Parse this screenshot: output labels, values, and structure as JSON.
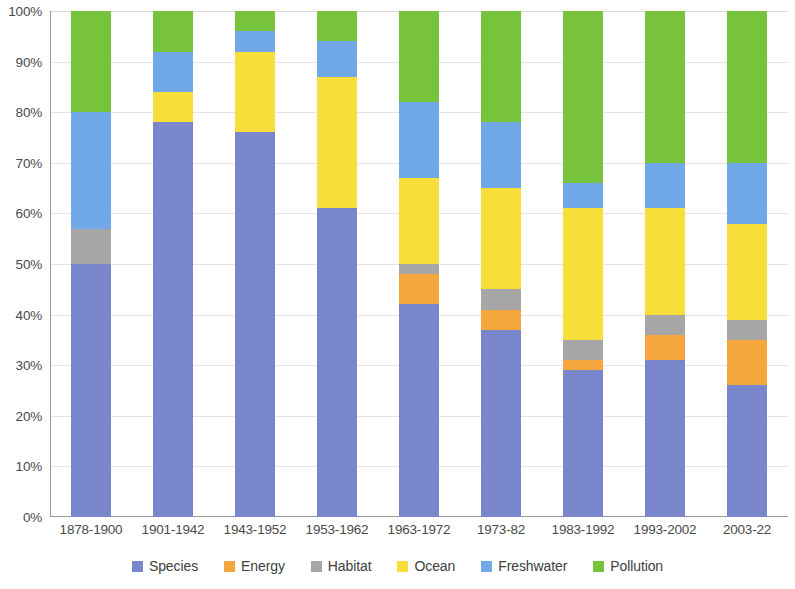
{
  "chart_data": {
    "type": "bar",
    "subtype": "stacked-100-percent",
    "title": "",
    "subtitle": "",
    "xlabel": "",
    "ylabel": "",
    "ylim": [
      0,
      100
    ],
    "y_tick_labels": [
      "100%",
      "90%",
      "80%",
      "70%",
      "60%",
      "50%",
      "40%",
      "30%",
      "20%",
      "10%",
      "0%"
    ],
    "y_tick_values": [
      100,
      90,
      80,
      70,
      60,
      50,
      40,
      30,
      20,
      10,
      0
    ],
    "grid": true,
    "legend_position": "bottom",
    "categories": [
      "1878-1900",
      "1901-1942",
      "1943-1952",
      "1953-1962",
      "1963-1972",
      "1973-82",
      "1983-1992",
      "1993-2002",
      "2003-22"
    ],
    "series": [
      {
        "name": "Species",
        "color": "#7b87cd",
        "values": [
          50,
          78,
          76,
          61,
          42,
          37,
          29,
          31,
          26
        ]
      },
      {
        "name": "Energy",
        "color": "#f5a63c",
        "values": [
          0,
          0,
          0,
          0,
          6,
          4,
          2,
          5,
          9
        ]
      },
      {
        "name": "Habitat",
        "color": "#a6a6a6",
        "values": [
          7,
          0,
          0,
          0,
          2,
          4,
          4,
          4,
          4
        ]
      },
      {
        "name": "Ocean",
        "color": "#f7de3a",
        "values": [
          0,
          6,
          16,
          26,
          17,
          20,
          26,
          21,
          19
        ]
      },
      {
        "name": "Freshwater",
        "color": "#70a8e8",
        "values": [
          23,
          8,
          4,
          7,
          15,
          13,
          5,
          9,
          12
        ]
      },
      {
        "name": "Pollution",
        "color": "#78c33c",
        "values": [
          20,
          8,
          4,
          6,
          18,
          22,
          34,
          30,
          30
        ]
      }
    ]
  },
  "legend": {
    "items": [
      {
        "label": "Species",
        "color": "#7b87cd"
      },
      {
        "label": "Energy",
        "color": "#f5a63c"
      },
      {
        "label": "Habitat",
        "color": "#a6a6a6"
      },
      {
        "label": "Ocean",
        "color": "#f7de3a"
      },
      {
        "label": "Freshwater",
        "color": "#70a8e8"
      },
      {
        "label": "Pollution",
        "color": "#78c33c"
      }
    ]
  },
  "colors": {
    "species": "#7b87cd",
    "energy": "#f5a63c",
    "habitat": "#a6a6a6",
    "ocean": "#f7de3a",
    "freshwater": "#70a8e8",
    "pollution": "#78c33c",
    "gridline": "#e4e4e4",
    "axis": "#9a9a9a",
    "tick_text": "#4a4a4a",
    "background": "#ffffff"
  }
}
